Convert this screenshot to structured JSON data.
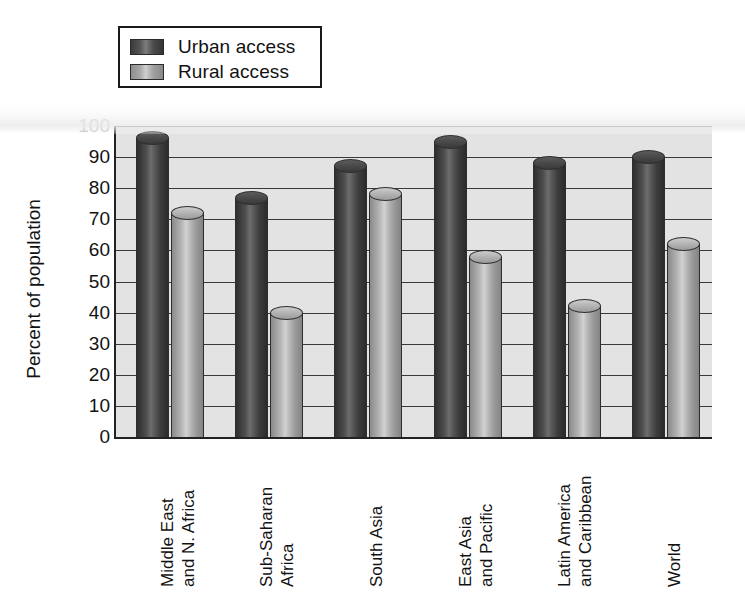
{
  "chart_data": {
    "type": "bar",
    "title": "",
    "xlabel": "",
    "ylabel": "Percent of population",
    "ylim": [
      0,
      100
    ],
    "ytick_values": [
      100,
      90,
      80,
      70,
      60,
      50,
      40,
      30,
      20,
      10,
      0
    ],
    "ytick_labels": [
      "100",
      "90",
      "80",
      "70",
      "60",
      "50",
      "40",
      "30",
      "20",
      "10",
      "0"
    ],
    "grid": true,
    "legend_position": "top-left",
    "categories": [
      "Middle East and N. Africa",
      "Sub-Saharan Africa",
      "South Asia",
      "East Asia and Pacific",
      "Latin America and Caribbean",
      "World"
    ],
    "category_lines": [
      [
        "Middle East",
        "and N. Africa"
      ],
      [
        "Sub-Saharan",
        "Africa"
      ],
      [
        "South Asia",
        ""
      ],
      [
        "East Asia",
        "and Pacific"
      ],
      [
        "Latin America",
        "and Caribbean"
      ],
      [
        "World",
        ""
      ]
    ],
    "series": [
      {
        "name": "Urban access",
        "color": "#454545",
        "values": [
          96,
          77,
          87,
          95,
          88,
          90
        ]
      },
      {
        "name": "Rural access",
        "color": "#b0b0b0",
        "values": [
          72,
          40,
          78,
          58,
          42,
          62
        ]
      }
    ]
  },
  "legend": {
    "items": [
      {
        "label": "Urban access",
        "swatch": "urban"
      },
      {
        "label": "Rural access",
        "swatch": "rural"
      }
    ]
  },
  "colors": {
    "plot_background": "#e3e3e3",
    "axis": "#222222",
    "gridline": "#3a3a3a",
    "urban": "#454545",
    "rural": "#b0b0b0",
    "text": "#121212"
  }
}
